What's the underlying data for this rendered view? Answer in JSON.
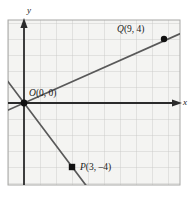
{
  "figure": {
    "title": "",
    "background_color": "#ffffff",
    "plot_background_color": "#f4f4f2",
    "grid_color": "#bdbdbd",
    "grid_border_color": "#9a9a9a",
    "axis_color": "#2b2b2b",
    "line_color": "#595959",
    "point_color": "#1a1a1a",
    "label_color": "#1a1a1a"
  },
  "axes": {
    "x_label": "x",
    "y_label": "y",
    "x_label_name": "x-axis-label",
    "y_label_name": "y-axis-label",
    "grid": true,
    "grid_step": 1,
    "x_range": [
      -1,
      10
    ],
    "y_range": [
      -6,
      5
    ],
    "unit_px": 16.0,
    "origin_px": [
      24,
      103
    ]
  },
  "points": [
    {
      "id": "O",
      "label": "O(0, 0)",
      "label_italic": "O",
      "label_rest": "(0, 0)",
      "x": 0,
      "y": 0,
      "px": [
        24,
        103
      ]
    },
    {
      "id": "Q",
      "label": "Q(9, 4)",
      "label_italic": "Q",
      "label_rest": "(9, 4)",
      "x": 9,
      "y": 4,
      "px": [
        164,
        39
      ]
    },
    {
      "id": "P",
      "label": "P(3, –4)",
      "label_italic": "P",
      "label_rest": "(3, –4)",
      "x": 3,
      "y": -4,
      "px": [
        72,
        167
      ]
    }
  ],
  "lines": [
    {
      "id": "line-OQ",
      "name": "line-through-O-and-Q",
      "through": [
        "O",
        "Q"
      ],
      "slope": 0.4444,
      "intercept": 0,
      "description": "ascending line through O(0,0) and Q(9,4)"
    },
    {
      "id": "line-OP",
      "name": "line-through-O-and-P",
      "through": [
        "O",
        "P"
      ],
      "slope": -1.3333,
      "intercept": 0,
      "description": "descending line through O(0,0) and P(3,-4)"
    }
  ]
}
